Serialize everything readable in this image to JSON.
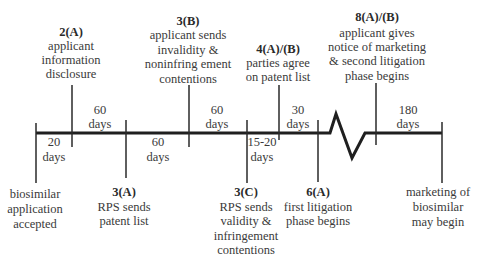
{
  "diagram": {
    "type": "timeline",
    "events_above": [
      {
        "id": "2A",
        "code": "2(A)",
        "lines": [
          "applicant",
          "information",
          "disclosure"
        ]
      },
      {
        "id": "3B",
        "code": "3(B)",
        "lines": [
          "applicant sends",
          "invalidity &",
          "noninfring ement",
          "contentions"
        ]
      },
      {
        "id": "4AB",
        "code": "4(A)/(B)",
        "lines": [
          "parties agree",
          "on patent list"
        ]
      },
      {
        "id": "8AB",
        "code": "8(A)/(B)",
        "lines": [
          "applicant gives",
          "notice of marketing",
          "& second litigation",
          "phase begins"
        ]
      }
    ],
    "events_below": [
      {
        "id": "start",
        "code": "",
        "lines": [
          "biosimilar",
          "application",
          "accepted"
        ]
      },
      {
        "id": "3A",
        "code": "3(A)",
        "lines": [
          "RPS sends",
          "patent list"
        ]
      },
      {
        "id": "3C",
        "code": "3(C)",
        "lines": [
          "RPS sends",
          "validity &",
          "infringement",
          "contentions"
        ]
      },
      {
        "id": "6A",
        "code": "6(A)",
        "lines": [
          "first litigation",
          "phase begins"
        ]
      },
      {
        "id": "end",
        "code": "",
        "lines": [
          "marketing of",
          "biosimilar",
          "may begin"
        ]
      }
    ],
    "intervals": [
      {
        "value": "20",
        "unit": "days",
        "between": [
          "start",
          "2A"
        ],
        "side": "below"
      },
      {
        "value": "60",
        "unit": "days",
        "between": [
          "2A",
          "3A"
        ],
        "side": "above"
      },
      {
        "value": "60",
        "unit": "days",
        "between": [
          "3A",
          "3B"
        ],
        "side": "below"
      },
      {
        "value": "60",
        "unit": "days",
        "between": [
          "3B",
          "3C"
        ],
        "side": "above"
      },
      {
        "value": "15-20",
        "unit": "days",
        "between": [
          "3C",
          "4AB"
        ],
        "side": "below"
      },
      {
        "value": "30",
        "unit": "days",
        "between": [
          "4AB",
          "6A"
        ],
        "side": "above"
      },
      {
        "value": "180",
        "unit": "days",
        "between": [
          "8AB",
          "end"
        ],
        "side": "above"
      }
    ],
    "break_symbol": "zigzag"
  }
}
